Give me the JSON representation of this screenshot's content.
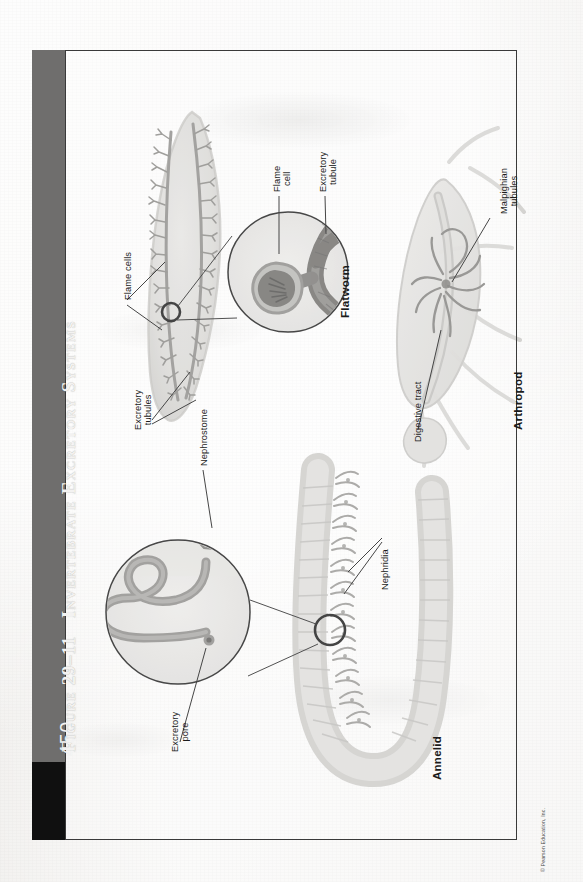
{
  "page": {
    "number": "450",
    "copyright": "© Pearson Education, Inc."
  },
  "figure": {
    "prefix": "Figure",
    "number": "29–11",
    "title": "Invertebrate Excretory Systems",
    "full_title": "Figure 29–11  Invertebrate Excretory Systems",
    "band_color": "#6f6e6d",
    "page_box_color": "#101010",
    "border_color": "#3a3a3a",
    "paper_color": "#efeeec"
  },
  "panels": [
    {
      "id": "flatworm",
      "heading": "Flatworm",
      "labels": [
        {
          "name": "flame-cells",
          "text": "Flame cells"
        },
        {
          "name": "excretory-tubules",
          "text": "Excretory\ntubules"
        },
        {
          "name": "flame-cell",
          "text": "Flame\ncell"
        },
        {
          "name": "excretory-tubule",
          "text": "Excretory\ntubule"
        }
      ]
    },
    {
      "id": "arthropod",
      "heading": "Arthropod",
      "labels": [
        {
          "name": "malpighian-tubules",
          "text": "Malpighian\ntubules"
        },
        {
          "name": "digestive-tract",
          "text": "Digestive tract"
        }
      ]
    },
    {
      "id": "annelid",
      "heading": "Annelid",
      "labels": [
        {
          "name": "nephrostome",
          "text": "Nephrostome"
        },
        {
          "name": "nephridia",
          "text": "Nephridia"
        },
        {
          "name": "excretory-pore",
          "text": "Excretory\npore"
        }
      ]
    }
  ],
  "labels": {
    "flame_cells": "Flame cells",
    "excretory_tubules": "Excretory\ntubules",
    "flame_cell": "Flame\ncell",
    "excretory_tubule": "Excretory\ntubule",
    "flatworm": "Flatworm",
    "malpighian_tubules": "Malpighian\ntubules",
    "digestive_tract": "Digestive tract",
    "arthropod": "Arthropod",
    "nephrostome": "Nephrostome",
    "nephridia": "Nephridia",
    "excretory_pore": "Excretory\npore",
    "annelid": "Annelid"
  }
}
